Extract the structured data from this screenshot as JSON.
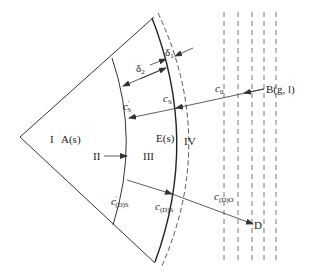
{
  "diagram": {
    "type": "sector-diffusion-schematic",
    "regions": {
      "region_I": "I",
      "region_I_label": "A(s)",
      "region_II": "II",
      "region_III": "III",
      "region_III_label": "E(s)",
      "region_IV": "IV"
    },
    "thickness_labels": {
      "delta2": "δ",
      "delta2_sub": "2",
      "delta1": "δ",
      "delta1_sub": "1"
    },
    "concentrations": {
      "c0": "c",
      "c0_sub": "0",
      "cS": "c",
      "cS_sub": "S",
      "cS_prime": "c",
      "cS_prime_sup": "'",
      "cS_prime_sub": "S",
      "cDS": "c",
      "cDS_sub": "(D)S",
      "cDS_prime": "c",
      "cDS_prime_sup": "'",
      "cDS_prime_sub": "(D)S",
      "cDO": "c",
      "cDO_sub": "(D)O"
    },
    "points": {
      "B": "B(g, l)",
      "D": "D"
    },
    "colors": {
      "line": "#333333",
      "dashed": "#555555",
      "background": "#ffffff"
    }
  }
}
